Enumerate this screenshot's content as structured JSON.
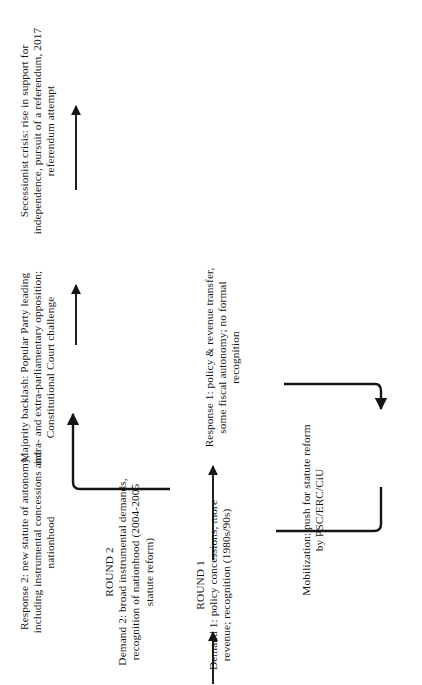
{
  "figure": {
    "type": "flow-diagram",
    "orientation": "rotated-90-ccw",
    "background": "#ffffff",
    "ink": "#151515"
  },
  "nodes": {
    "round1": {
      "id": "round1",
      "label_line1": "ROUND 1",
      "label_line2": "Demand 1:",
      "label_line3": "policy",
      "label_line4": "concessions,",
      "label_line5": "more revenue;",
      "label_line6": "recognition",
      "label_line7": "(1980s/90s)",
      "text": "ROUND 1\nDemand 1: policy concessions, more revenue; recognition (1980s/90s)"
    },
    "response1": {
      "id": "response1",
      "text": "Response 1: policy & revenue transfer, some fiscal autonomy; no formal recognition"
    },
    "mobilization": {
      "id": "mobilization",
      "text": "Mobilization: push for statute reform by PSC/ERC/CiU"
    },
    "round2": {
      "id": "round2",
      "label_line1": "ROUND 2",
      "text": "ROUND 2\nDemand 2: broad instrumental demands, recognition of nationhood (2004-2005 statute reform)"
    },
    "response2": {
      "id": "response2",
      "text": "Response 2: new statute of autonomy, including instrumental concessions and nationhood"
    },
    "backlash": {
      "id": "backlash",
      "text": "Majority backlash: Popular Party leading intra- and extra-parliamentary opposition; Constitutional Court challenge"
    },
    "secession": {
      "id": "secession",
      "text": "Secessionist crisis: rise in support for independence, pursuit of a referendum, 2017 referendum attempt"
    }
  },
  "arrows": [
    {
      "id": "entry-to-round1",
      "kind": "straight",
      "from": "start",
      "to": "round1"
    },
    {
      "id": "round1-to-response1",
      "kind": "straight",
      "from": "round1",
      "to": "response1"
    },
    {
      "id": "response1-to-mobilization",
      "kind": "elbow",
      "from": "response1",
      "to": "mobilization"
    },
    {
      "id": "mobilization-to-round2",
      "kind": "elbow",
      "from": "mobilization",
      "to": "round2"
    },
    {
      "id": "round2-to-response2",
      "kind": "elbow",
      "from": "round2",
      "to": "response2"
    },
    {
      "id": "response2-to-backlash",
      "kind": "straight",
      "from": "response2",
      "to": "backlash"
    },
    {
      "id": "backlash-to-secession",
      "kind": "straight",
      "from": "backlash",
      "to": "secession"
    }
  ]
}
